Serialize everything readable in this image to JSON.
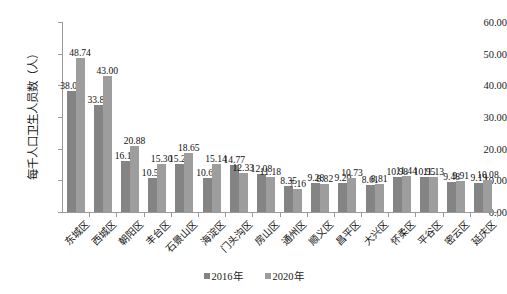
{
  "chart_data": {
    "type": "bar",
    "title": "",
    "xlabel": "",
    "ylabel": "每千人口卫生人员数（人）",
    "ylim": [
      0,
      60
    ],
    "ytick_labels": [
      "0.00",
      "10.00",
      "20.00",
      "30.00",
      "40.00",
      "50.00",
      "60.00"
    ],
    "ytick_values": [
      0,
      10,
      20,
      30,
      40,
      50,
      60
    ],
    "grid": false,
    "legend_position": "bottom-center",
    "categories": [
      "东城区",
      "西城区",
      "朝阳区",
      "丰台区",
      "石景山区",
      "海淀区",
      "门头沟区",
      "房山区",
      "通州区",
      "顺义区",
      "昌平区",
      "大兴区",
      "怀柔区",
      "平谷区",
      "密云区",
      "延庆区"
    ],
    "series": [
      {
        "name": "2016年",
        "color": "#848484",
        "values": [
          38.08,
          33.81,
          16.14,
          10.59,
          15.21,
          10.64,
          14.77,
          12.08,
          8.35,
          9.28,
          9.2,
          8.61,
          10.98,
          10.95,
          9.48,
          9.19
        ],
        "labels": [
          "38.08",
          "33.81",
          "16.14",
          "10.59",
          "15.21",
          "10.64",
          "14.77",
          "12.08",
          "8.35",
          "9.28",
          "9.20",
          "8.61",
          "10.98",
          "10.95",
          "9.48",
          "9.19"
        ]
      },
      {
        "name": "2020年",
        "color": "#9d9d9d",
        "values": [
          48.74,
          43.0,
          20.88,
          15.3,
          18.65,
          15.14,
          12.33,
          11.18,
          7.16,
          8.82,
          10.73,
          8.81,
          11.44,
          11.13,
          9.91,
          10.08
        ],
        "labels": [
          "48.74",
          "43.00",
          "20.88",
          "15.30",
          "18.65",
          "15.14",
          "12.33",
          "11.18",
          "7.16",
          "8.82",
          "10.73",
          "8.81",
          "11.44",
          "11.13",
          "9.91",
          "10.08"
        ]
      }
    ]
  }
}
